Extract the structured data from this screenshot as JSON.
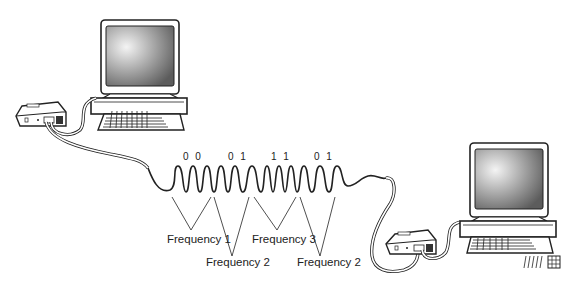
{
  "diagram": {
    "nodes": [
      {
        "id": "computer-left",
        "type": "computer"
      },
      {
        "id": "modem-left",
        "type": "modem"
      },
      {
        "id": "modem-right",
        "type": "modem"
      },
      {
        "id": "computer-right",
        "type": "computer"
      }
    ],
    "edges": [
      {
        "from": "computer-left",
        "to": "modem-left",
        "type": "cable"
      },
      {
        "from": "modem-left",
        "to": "modem-right",
        "type": "phone-line-signal"
      },
      {
        "from": "modem-right",
        "to": "computer-right",
        "type": "cable"
      }
    ],
    "bit_pairs": [
      {
        "label": "0 0",
        "x": 208
      },
      {
        "label": "0 1",
        "x": 236
      },
      {
        "label": "1 1",
        "x": 283
      },
      {
        "label": "0 1",
        "x": 323
      }
    ],
    "frequency_labels": [
      {
        "label": "Frequency 1",
        "x": 167,
        "y": 242
      },
      {
        "label": "Frequency 2",
        "x": 206,
        "y": 266
      },
      {
        "label": "Frequency 3",
        "x": 252,
        "y": 242
      },
      {
        "label": "Frequency 2",
        "x": 297,
        "y": 266
      }
    ],
    "colors": {
      "line": "#222222",
      "screen_dark": "#6a6a6a",
      "screen_light": "#f2f2f2",
      "background": "#ffffff"
    }
  }
}
